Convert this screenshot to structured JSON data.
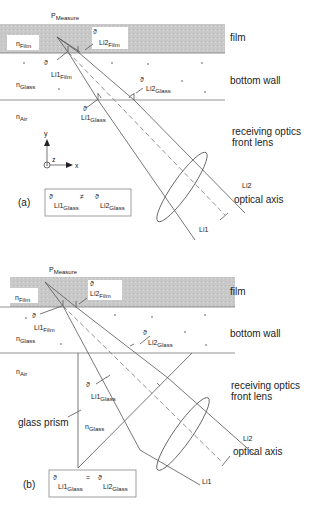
{
  "panel_a": {
    "tag": "(a)",
    "layers": {
      "film": "film",
      "bottom_wall": "bottom wall"
    },
    "media": {
      "film": "n",
      "film_sub": "Film",
      "glass": "n",
      "glass_sub": "Glass",
      "air": "n",
      "air_sub": "Air"
    },
    "point": {
      "p": "P",
      "p_sub": "Measure"
    },
    "angles": {
      "theta": "ϑ",
      "li1_film": "Li1",
      "li1_film_sub": "Film",
      "li2_film": "Li2",
      "li2_film_sub": "Film",
      "li1_glass": "Li1",
      "li1_glass_sub": "Glass",
      "li2_glass": "Li2",
      "li2_glass_sub": "Glass"
    },
    "axes": {
      "x": "x",
      "y": "y",
      "z": "z"
    },
    "optics": {
      "lens_line1": "receiving optics",
      "lens_line2": "front lens",
      "axis": "optical axis",
      "li1": "Li1",
      "li2": "Li2"
    },
    "relation": {
      "lhs": "Li1",
      "lhs_sub": "Glass",
      "op": "≠",
      "rhs": "Li2",
      "rhs_sub": "Glass",
      "theta": "ϑ"
    }
  },
  "panel_b": {
    "tag": "(b)",
    "layers": {
      "film": "film",
      "bottom_wall": "bottom wall"
    },
    "media": {
      "film": "n",
      "film_sub": "Film",
      "glass": "n",
      "glass_sub": "Glass",
      "air": "n",
      "air_sub": "Air",
      "prism_glass": "n",
      "prism_glass_sub": "Glass"
    },
    "point": {
      "p": "P",
      "p_sub": "Measure"
    },
    "angles": {
      "theta": "ϑ",
      "li1_film": "Li1",
      "li1_film_sub": "Film",
      "li2_film": "Li2",
      "li2_film_sub": "Film",
      "li1_glass": "Li1",
      "li1_glass_sub": "Glass",
      "li2_glass": "Li2",
      "li2_glass_sub": "Glass"
    },
    "prism_label": "glass prism",
    "optics": {
      "lens_line1": "receiving optics",
      "lens_line2": "front lens",
      "axis": "optical axis",
      "li1": "Li1",
      "li2": "Li2"
    },
    "relation": {
      "lhs": "Li1",
      "lhs_sub": "Glass",
      "op": "=",
      "rhs": "Li2",
      "rhs_sub": "Glass",
      "theta": "ϑ"
    }
  },
  "colors": {
    "film_fill": "#c8c8c8",
    "line": "#555555",
    "label_bg": "#ffffff"
  }
}
